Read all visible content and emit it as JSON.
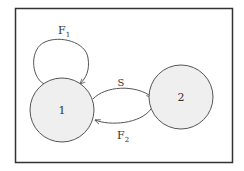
{
  "diagram": {
    "type": "state-transition",
    "nodes": [
      {
        "id": "1",
        "label": "1"
      },
      {
        "id": "2",
        "label": "2"
      }
    ],
    "edges": [
      {
        "from": "1",
        "to": "1",
        "label": "F",
        "subscript": "1"
      },
      {
        "from": "1",
        "to": "2",
        "label": "S",
        "subscript": ""
      },
      {
        "from": "2",
        "to": "1",
        "label": "F",
        "subscript": "2"
      }
    ],
    "colors": {
      "frame": "#333333",
      "node_fill": "#efefef",
      "node_stroke": "#555555",
      "edge": "#555555"
    }
  }
}
